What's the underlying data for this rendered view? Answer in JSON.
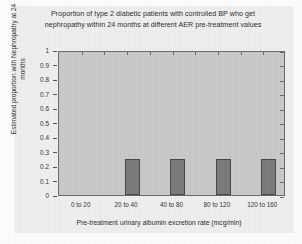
{
  "chart_data": {
    "type": "bar",
    "title": "Proportion of type 2 diabetic patients with controlled BP who get nephropathy within 24 months at different AER pre-treatment values",
    "title_lines": [
      "Proportion of type 2 diabetic patients with controlled BP who get",
      "nephropathy within 24 months at different AER pre-treatment values"
    ],
    "xlabel": "Pre-treatment urinary albumin excretion rate (mcg/min)",
    "ylabel": "Estimated proportion with Nephropathy at 24 months",
    "ylabel_lines": [
      "Estimated proportion with Nephropathy at 24",
      "months"
    ],
    "categories": [
      "0 to 20",
      "20 to 40",
      "40 to 80",
      "80 to 120",
      "120 to 160"
    ],
    "values": [
      0,
      0.25,
      0.25,
      0.25,
      0.25
    ],
    "ylim": [
      0,
      1
    ],
    "ytick_labels": [
      "1",
      "0.9",
      "0.8",
      "0.7",
      "0.6",
      "0.5",
      "0.4",
      "0.3",
      "0.2",
      "0.1",
      "0"
    ],
    "ytick_values": [
      1,
      0.9,
      0.8,
      0.7,
      0.6,
      0.5,
      0.4,
      0.3,
      0.2,
      0.1,
      0
    ],
    "grid": false,
    "legend": null,
    "colors": {
      "bar_fill": "#7b7b7b",
      "bar_border": "#4a4a4a",
      "plot_background": "#c9c9c9",
      "figure_background": "#efefef",
      "axis": "#6a6a6a",
      "text": "#2e2e2e"
    }
  }
}
